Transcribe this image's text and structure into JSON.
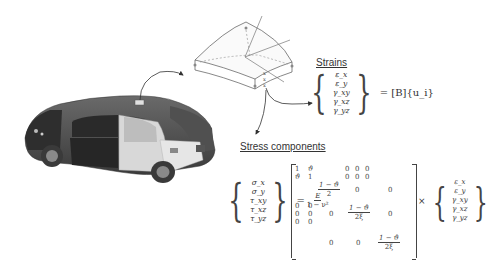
{
  "figure": {
    "car_label": "vehicle finite element model",
    "shell_element_label": "curved shell element",
    "strains": {
      "heading": "Strains",
      "vector": [
        "ε_x",
        "ε_y",
        "γ_xy",
        "γ_xz",
        "γ_yz"
      ],
      "rhs": "= [B]{u_i}"
    },
    "stress": {
      "heading": "Stress components",
      "lhs_vector": [
        "σ_x",
        "σ_y",
        "τ_xy",
        "τ_xz",
        "τ_yz"
      ],
      "equals": "=",
      "coef_num": "E",
      "coef_den": "1 − ν²",
      "matrix": {
        "r1": [
          "1",
          "ϑ",
          "0",
          "0",
          "0"
        ],
        "r2": [
          "ϑ",
          "1",
          "0",
          "0",
          "0"
        ],
        "r3_frac_num": "1 − ϑ",
        "r3_frac_den": "2",
        "r3_zeros": [
          "0",
          "0"
        ],
        "r4": [
          "0",
          "0"
        ],
        "r5": [
          "0",
          "0"
        ],
        "r6": [
          "0",
          "0"
        ],
        "r45_zero": "0",
        "r4_frac_num": "1 − ϑ",
        "r4_frac_den": "2ξ",
        "r4_zero_right": "0",
        "r7_zeros": [
          "0",
          "0"
        ],
        "r7_frac_num": "1 − ϑ",
        "r7_frac_den": "2ξ"
      },
      "times": "×",
      "rhs_vector": [
        "ε_x",
        "ε_y",
        "γ_xy",
        "γ_xz",
        "γ_yz"
      ]
    }
  }
}
